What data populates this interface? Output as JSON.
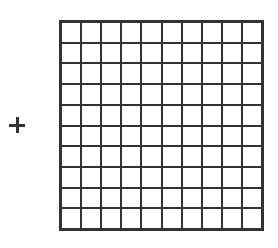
{
  "diagram": {
    "operator_symbol": "+",
    "hundred_block": {
      "rows": 10,
      "columns": 10,
      "total_cells": 100,
      "line_color": "#333333",
      "fill_color": "#ffffff"
    }
  }
}
